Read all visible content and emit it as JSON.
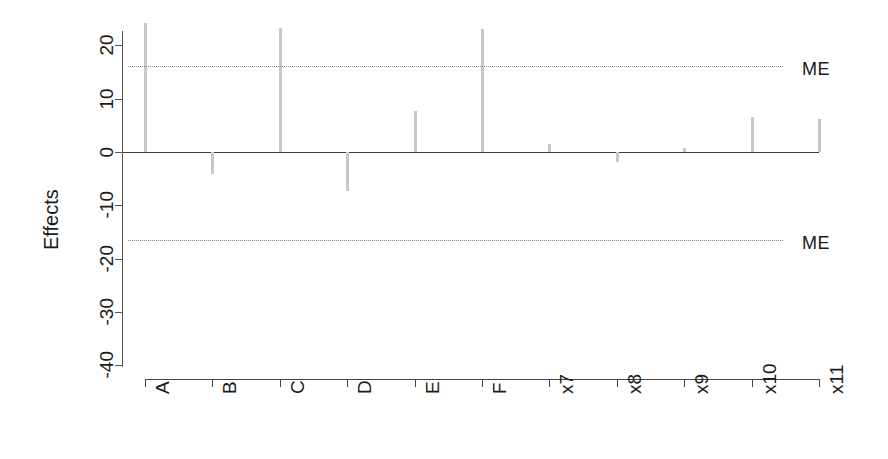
{
  "chart_data": {
    "type": "bar",
    "title": "",
    "subtitle": "",
    "xlabel": "",
    "ylabel": "Effects",
    "orientation": "vertical",
    "grid": false,
    "legend": null,
    "categories": [
      "A",
      "B",
      "C",
      "D",
      "E",
      "F",
      "x7",
      "x8",
      "x9",
      "x10",
      "x11"
    ],
    "values": [
      24.2,
      -4.1,
      23.3,
      -7.3,
      7.7,
      23.0,
      1.5,
      -1.8,
      0.7,
      6.6,
      6.2
    ],
    "ylim": [
      -44,
      25
    ],
    "yticks": [
      20,
      10,
      0,
      -10,
      -20,
      -30,
      -40
    ],
    "ytick_labels": [
      "20",
      "10",
      "0",
      "-10",
      "-20",
      "-30",
      "-40"
    ],
    "annotations": [
      {
        "name": "margin-of-error-upper",
        "label": "ME",
        "value": 16.3,
        "style": "dotted"
      },
      {
        "name": "margin-of-error-lower",
        "label": "ME",
        "value": -16.3,
        "style": "dotted"
      }
    ],
    "reference_lines": [
      {
        "name": "zero-line",
        "value": 0
      }
    ],
    "colors": {
      "bar": "#c8c8c8",
      "axis": "#444444",
      "zero_line": "#3b3b3b",
      "me_line": "#8a8a8a",
      "text": "#1a1a1a",
      "background": "#ffffff"
    }
  },
  "axis": {
    "y_title": "Effects",
    "y_labels": [
      "20",
      "10",
      "0",
      "-10",
      "-20",
      "-30",
      "-40"
    ],
    "x_labels": [
      "A",
      "B",
      "C",
      "D",
      "E",
      "F",
      "x7",
      "x8",
      "x9",
      "x10",
      "x11"
    ]
  },
  "annotations": {
    "me_upper_label": "ME",
    "me_lower_label": "ME"
  }
}
